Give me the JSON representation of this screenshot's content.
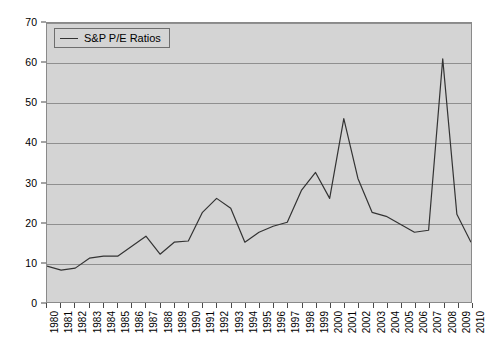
{
  "chart_data": {
    "type": "line",
    "title": "",
    "subtitle": "",
    "xlabel": "",
    "ylabel": "",
    "xlim": [
      1980,
      2010
    ],
    "ylim": [
      0,
      70
    ],
    "grid": true,
    "legend_position": "top-left",
    "legend": [
      "S&P P/E Ratios"
    ],
    "y_ticks": [
      0,
      10,
      20,
      30,
      40,
      50,
      60,
      70
    ],
    "categories": [
      "1980",
      "1981",
      "1982",
      "1983",
      "1984",
      "1985",
      "1986",
      "1987",
      "1988",
      "1989",
      "1990",
      "1991",
      "1992",
      "1993",
      "1994",
      "1995",
      "1996",
      "1997",
      "1998",
      "1999",
      "2000",
      "2001",
      "2002",
      "2003",
      "2004",
      "2005",
      "2006",
      "2007",
      "2008",
      "2009",
      "2010"
    ],
    "series": [
      {
        "name": "S&P P/E Ratios",
        "color": "#333333",
        "values": [
          9.0,
          8.0,
          8.5,
          11.0,
          11.5,
          11.5,
          14.0,
          16.5,
          12.0,
          15.0,
          15.3,
          22.5,
          26.0,
          23.5,
          15.0,
          17.5,
          19.0,
          20.0,
          28.0,
          32.5,
          26.0,
          46.0,
          31.0,
          22.5,
          21.5,
          19.5,
          17.5,
          18.0,
          61.0,
          22.0,
          15.0
        ]
      }
    ]
  },
  "legend": {
    "label": "S&P P/E Ratios"
  },
  "axes": {
    "y": {
      "ticks": [
        "0",
        "10",
        "20",
        "30",
        "40",
        "50",
        "60",
        "70"
      ]
    },
    "x": {
      "ticks": [
        "1980",
        "1981",
        "1982",
        "1983",
        "1984",
        "1985",
        "1986",
        "1987",
        "1988",
        "1989",
        "1990",
        "1991",
        "1992",
        "1993",
        "1994",
        "1995",
        "1996",
        "1997",
        "1998",
        "1999",
        "2000",
        "2001",
        "2002",
        "2003",
        "2004",
        "2005",
        "2006",
        "2007",
        "2008",
        "2009",
        "2010"
      ]
    }
  },
  "style": {
    "plot_background": "#d4d4d4",
    "gridline_color": "#8f8f8f",
    "axis_color": "#4a4a4a",
    "series_color": "#333333",
    "page_background": "#ffffff"
  }
}
